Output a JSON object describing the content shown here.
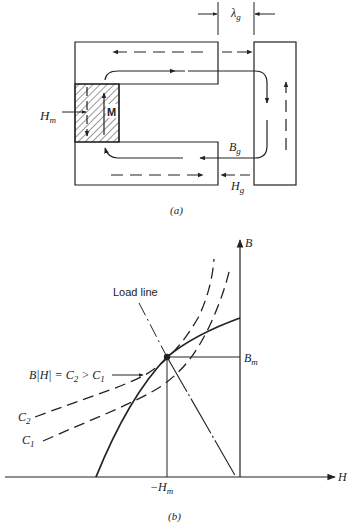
{
  "figure_a": {
    "caption": "(a)",
    "gap_label": "λ",
    "gap_sub": "g",
    "magnet_label": "M",
    "hm_label": "H",
    "hm_sub": "m",
    "bg_label": "B",
    "bg_sub": "g",
    "hg_label": "H",
    "hg_sub": "g"
  },
  "figure_b": {
    "caption": "(b)",
    "b_axis_label": "B",
    "h_axis_label": "H",
    "bm_label": "B",
    "bm_sub": "m",
    "neg_hm_label": "−H",
    "neg_hm_sub": "m",
    "load_line_label": "Load line",
    "energy_label_prefix": "B|H| = C",
    "energy_label_sub1": "2",
    "energy_label_mid": " > C",
    "energy_label_sub2": "1",
    "c2_label": "C",
    "c2_sub": "2",
    "c1_label": "C",
    "c1_sub": "1"
  },
  "colors": {
    "ink": "#222222",
    "background": "#ffffff"
  }
}
